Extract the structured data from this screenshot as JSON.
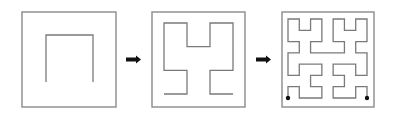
{
  "diagram": {
    "colors": {
      "frame": "#8a8a8a",
      "curve": "#7a7a7a",
      "arrow": "#111111",
      "endpoint": "#111111",
      "background": "#ffffff"
    },
    "panels": [
      {
        "name": "hilbert-order-1",
        "order": 1,
        "frame": {
          "x": 22,
          "y": 12,
          "w": 94,
          "h": 95
        },
        "grid": {
          "x0": 46,
          "y0": 35,
          "x1": 93,
          "y1": 82
        },
        "endpoints_marked": false
      },
      {
        "name": "hilbert-order-2",
        "order": 2,
        "frame": {
          "x": 152,
          "y": 12,
          "w": 93,
          "h": 95
        },
        "grid": {
          "x0": 164,
          "y0": 23,
          "x1": 233,
          "y1": 94
        },
        "endpoints_marked": false
      },
      {
        "name": "hilbert-order-3",
        "order": 3,
        "frame": {
          "x": 282,
          "y": 12,
          "w": 92,
          "h": 95
        },
        "grid": {
          "x0": 288,
          "y0": 19,
          "x1": 367,
          "y1": 98
        },
        "endpoints_marked": true,
        "endpoint_radius": 2.2
      }
    ],
    "arrows": [
      {
        "name": "arrow-1-to-2",
        "x": 126,
        "y": 59.5,
        "length": 15
      },
      {
        "name": "arrow-2-to-3",
        "x": 256,
        "y": 59.5,
        "length": 15
      }
    ]
  }
}
